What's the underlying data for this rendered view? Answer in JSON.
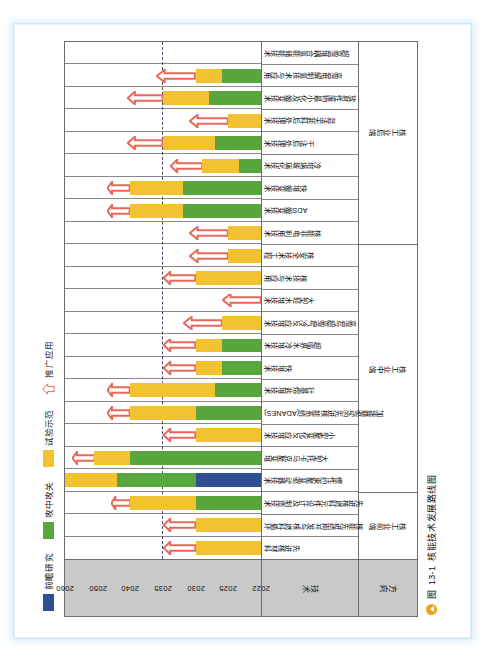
{
  "caption": {
    "marker": "图",
    "number": "13-1",
    "text": "核能技术发展路线图"
  },
  "legend": {
    "items": [
      {
        "key": "frontier",
        "label": "前瞻研究",
        "color": "#2f4f93",
        "shape": "swatch"
      },
      {
        "key": "keygap",
        "label": "攻中攻关",
        "color": "#59a63f",
        "shape": "swatch"
      },
      {
        "key": "demo",
        "label": "试验示范",
        "color": "#f2c230",
        "shape": "swatch"
      },
      {
        "key": "rollout",
        "label": "推广应用",
        "color": "#e8695a",
        "shape": "arrow"
      }
    ]
  },
  "axis_headers": {
    "direction": "方向",
    "technology": "技术"
  },
  "chart_data": {
    "type": "bar",
    "title": "核能技术发展路线图",
    "xlabel": "技术",
    "ylabel": "年份",
    "ylim": [
      2022,
      2060
    ],
    "grid": true,
    "legend_position": "top-left",
    "tick_labels": [
      "2022",
      "2025",
      "2030",
      "2035",
      "2040",
      "2050",
      "2060"
    ],
    "tick_values": [
      2022,
      2025,
      2030,
      2035,
      2040,
      2050,
      2060
    ],
    "dashed_reference_year": 2035,
    "stack_order": [
      "frontier",
      "keygap",
      "demo",
      "rollout"
    ],
    "series": [
      {
        "name": "前瞻研究",
        "color": "#2f4f93"
      },
      {
        "name": "攻中攻关",
        "color": "#59a63f"
      },
      {
        "name": "试验示范",
        "color": "#f2c230"
      },
      {
        "name": "推广应用",
        "color": "#e8695a"
      }
    ],
    "groups": [
      {
        "name": "核工业前端",
        "span": 3
      },
      {
        "name": "核工业中端",
        "span": 11
      },
      {
        "name": "核工业后端",
        "span": 10
      }
    ],
    "categories": [
      "先进核材料",
      "核能先进结构开发与核燃料循环",
      "先进核燃料元件设计及制造技术",
      "惯性约束聚变驱动器技术",
      "大型托卡马克聚变堆",
      "小型聚变化反应堆技术",
      "加速器驱动的先进核能系统(ADANES)",
      "钍基熔盐堆技术",
      "快堆技术",
      "超临界水冷堆技术",
      "高温与超高温气冷反应堆技术",
      "大型轻水堆技术",
      "核技术与应用",
      "核安全技术工程",
      "核能非电利用技术",
      "ADS嬗变技术",
      "快堆嬗变技术",
      "冷坩埚玻璃化技术",
      "干法后处理技术",
      "混法无盐料后处理技术",
      "放射性废物最小化及嬗变技术",
      "高温电解制氢技术与应用",
      "超高温堆耦合氢能储能技术"
    ],
    "bars": [
      {
        "category": "先进核材料",
        "frontier": null,
        "keygap": null,
        "demo": [
          2022,
          2030
        ],
        "rollout": [
          2030,
          2035
        ]
      },
      {
        "category": "核能先进结构开发与核燃料循环",
        "frontier": null,
        "keygap": null,
        "demo": [
          2022,
          2030
        ],
        "rollout": [
          2030,
          2035
        ]
      },
      {
        "category": "先进核燃料元件设计及制造技术",
        "frontier": null,
        "keygap": [
          2022,
          2030
        ],
        "demo": [
          2030,
          2040
        ],
        "rollout": [
          2040,
          2046
        ]
      },
      {
        "category": "惯性约束聚变驱动器技术",
        "frontier": [
          2022,
          2030
        ],
        "keygap": [
          2030,
          2044
        ],
        "demo": [
          2044,
          2060
        ],
        "rollout": null
      },
      {
        "category": "大型托卡马克聚变堆",
        "frontier": null,
        "keygap": [
          2022,
          2040
        ],
        "demo": [
          2040,
          2051
        ],
        "rollout": [
          2051,
          2058
        ]
      },
      {
        "category": "小型聚变化反应堆技术",
        "frontier": null,
        "keygap": null,
        "demo": [
          2022,
          2030
        ],
        "rollout": [
          2030,
          2035
        ]
      },
      {
        "category": "加速器驱动的先进核能系统(ADANES)",
        "frontier": null,
        "keygap": [
          2022,
          2030
        ],
        "demo": [
          2030,
          2040
        ],
        "rollout": [
          2040,
          2047
        ]
      },
      {
        "category": "钍基熔盐堆技术",
        "frontier": null,
        "keygap": [
          2022,
          2027
        ],
        "demo": [
          2027,
          2040
        ],
        "rollout": [
          2040,
          2047
        ]
      },
      {
        "category": "快堆技术",
        "frontier": null,
        "keygap": [
          2022,
          2026
        ],
        "demo": [
          2026,
          2030
        ],
        "rollout": [
          2030,
          2035
        ]
      },
      {
        "category": "超临界水冷堆技术",
        "frontier": null,
        "keygap": [
          2022,
          2026
        ],
        "demo": [
          2026,
          2030
        ],
        "rollout": [
          2030,
          2035
        ]
      },
      {
        "category": "高温与超高温气冷反应堆技术",
        "frontier": null,
        "keygap": null,
        "demo": [
          2022,
          2026
        ],
        "rollout": [
          2026,
          2032
        ]
      },
      {
        "category": "大型轻水堆技术",
        "frontier": null,
        "keygap": null,
        "demo": null,
        "rollout": [
          2022,
          2026
        ]
      },
      {
        "category": "核技术与应用",
        "frontier": null,
        "keygap": null,
        "demo": [
          2022,
          2030
        ],
        "rollout": [
          2030,
          2035
        ]
      },
      {
        "category": "核安全技术工程",
        "frontier": null,
        "keygap": null,
        "demo": [
          2022,
          2025
        ],
        "rollout": [
          2025,
          2031
        ]
      },
      {
        "category": "核能非电利用技术",
        "frontier": null,
        "keygap": null,
        "demo": [
          2022,
          2025
        ],
        "rollout": [
          2025,
          2031
        ]
      },
      {
        "category": "ADS嬗变技术",
        "frontier": null,
        "keygap": [
          2022,
          2032
        ],
        "demo": [
          2032,
          2040
        ],
        "rollout": [
          2040,
          2047
        ]
      },
      {
        "category": "快堆嬗变技术",
        "frontier": null,
        "keygap": [
          2022,
          2032
        ],
        "demo": [
          2032,
          2040
        ],
        "rollout": [
          2040,
          2047
        ]
      },
      {
        "category": "冷坩埚玻璃化技术",
        "frontier": null,
        "keygap": [
          2022,
          2024
        ],
        "demo": [
          2024,
          2029
        ],
        "rollout": [
          2029,
          2034
        ]
      },
      {
        "category": "干法后处理技术",
        "frontier": null,
        "keygap": [
          2022,
          2027
        ],
        "demo": [
          2027,
          2035
        ],
        "rollout": [
          2035,
          2041
        ]
      },
      {
        "category": "混法无盐料后处理技术",
        "frontier": null,
        "keygap": null,
        "demo": [
          2022,
          2025
        ],
        "rollout": [
          2025,
          2031
        ]
      },
      {
        "category": "放射性废物最小化及嬗变技术",
        "frontier": null,
        "keygap": [
          2022,
          2028
        ],
        "demo": [
          2028,
          2035
        ],
        "rollout": [
          2035,
          2041
        ]
      },
      {
        "category": "高温电解制氢技术与应用",
        "frontier": null,
        "keygap": [
          2022,
          2026
        ],
        "demo": [
          2026,
          2030
        ],
        "rollout": [
          2030,
          2036
        ]
      },
      {
        "category": "超高温堆耦合氢能储能技术",
        "frontier": null,
        "keygap": null,
        "demo": null,
        "rollout": null
      }
    ]
  }
}
